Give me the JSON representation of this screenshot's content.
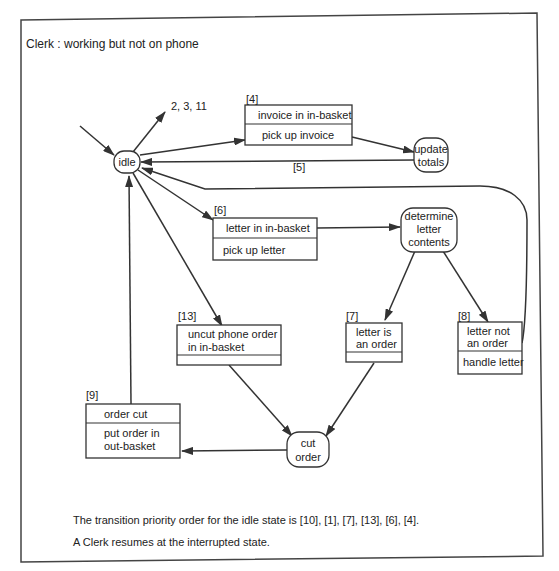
{
  "diagram": {
    "title": "Clerk : working but not on phone",
    "states": {
      "idle": {
        "label": "idle"
      },
      "update_totals": {
        "lines": [
          "update",
          "totals"
        ]
      },
      "determine_letter_contents": {
        "lines": [
          "determine",
          "letter",
          "contents"
        ]
      },
      "cut_order": {
        "lines": [
          "cut",
          "order"
        ]
      }
    },
    "transitions": {
      "t4": {
        "id": "[4]",
        "event": "invoice in in-basket",
        "action": "pick up invoice"
      },
      "t5": {
        "id": "[5]"
      },
      "t6": {
        "id": "[6]",
        "event": "letter in in-basket",
        "action": "pick up letter"
      },
      "t13": {
        "id": "[13]",
        "event_lines": [
          "uncut phone order",
          "in in-basket"
        ],
        "action": ""
      },
      "t7": {
        "id": "[7]",
        "event_lines": [
          "letter is",
          "an order"
        ],
        "action": ""
      },
      "t8": {
        "id": "[8]",
        "event_lines": [
          "letter not",
          "an order"
        ],
        "action": "handle letter"
      },
      "t9": {
        "id": "[9]",
        "event": "order cut",
        "action_lines": [
          "put order in",
          "out-basket"
        ]
      },
      "external": {
        "label": "2, 3, 11"
      }
    },
    "notes": [
      "The transition priority order for the idle state is [10], [1], [7], [13], [6], [4].",
      "A Clerk resumes at the interrupted state."
    ]
  }
}
